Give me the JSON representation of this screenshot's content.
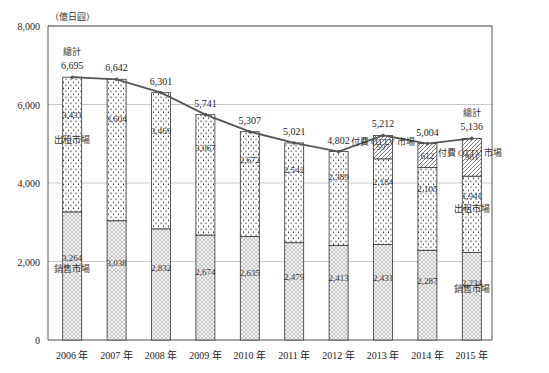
{
  "chart_data": {
    "type": "bar",
    "stacked": true,
    "title": "",
    "unit_label": "（億日圓）",
    "xlabel": "",
    "ylabel": "億日圓",
    "ylim": [
      0,
      8000
    ],
    "yticks": [
      "0",
      "2,000",
      "4,000",
      "6,000",
      "8,000"
    ],
    "ytick_values": [
      0,
      2000,
      4000,
      6000,
      8000
    ],
    "grid": true,
    "categories": [
      "2006 年",
      "2007 年",
      "2008 年",
      "2009 年",
      "2010 年",
      "2011 年",
      "2012 年",
      "2013 年",
      "2014 年",
      "2015 年"
    ],
    "series": [
      {
        "name": "銷售市場",
        "pattern": "crosshatch",
        "values": [
          3264,
          3038,
          2832,
          2674,
          2635,
          2479,
          2413,
          2431,
          2287,
          2234
        ],
        "labels": [
          "3,264",
          "3,038",
          "2,832",
          "2,674",
          "2,635",
          "2,479",
          "2,413",
          "2,431",
          "2,287",
          "2,234"
        ]
      },
      {
        "name": "出租市場",
        "pattern": "dots",
        "values": [
          3431,
          3604,
          3469,
          3067,
          2672,
          2542,
          2389,
          2184,
          2105,
          1941
        ],
        "labels": [
          "3,431",
          "3,604",
          "3,469",
          "3,067",
          "2,672",
          "2,542",
          "2,389",
          "2,184",
          "2,105",
          "1,941"
        ]
      },
      {
        "name": "付費 OTTV 市場",
        "pattern": "diagonal",
        "values": [
          0,
          0,
          0,
          0,
          0,
          0,
          0,
          597,
          612,
          961
        ],
        "labels": [
          "",
          "",
          "",
          "",
          "",
          "",
          "",
          "597",
          "612",
          "961"
        ]
      }
    ],
    "total": {
      "name": "總計",
      "type": "line",
      "values": [
        6695,
        6642,
        6301,
        5741,
        5307,
        5021,
        4802,
        5212,
        5004,
        5136
      ],
      "labels": [
        "6,695",
        "6,642",
        "6,301",
        "5,741",
        "5,307",
        "5,021",
        "4,802",
        "5,212",
        "5,004",
        "5,136"
      ]
    },
    "annotations": [
      "總計",
      "出租市場",
      "銷售市場",
      "付費 OTTV 市場"
    ]
  }
}
